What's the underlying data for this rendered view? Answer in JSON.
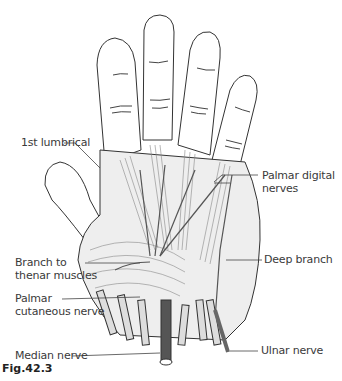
{
  "figure": {
    "caption": "Fig.42.3"
  },
  "labels": {
    "first_lumbrical": "1st lumbrical",
    "palmar_digital_nerves": "Palmar digital\nnerves",
    "deep_branch": "Deep branch",
    "branch_to_thenar": "Branch to\nthenar muscles",
    "palmar_cutaneous": "Palmar\ncutaneous nerve",
    "median_nerve": "Median nerve",
    "ulnar_nerve": "Ulnar nerve"
  },
  "colors": {
    "outline": "#333333",
    "muscle_fill": "#e6e6e6",
    "muscle_shade": "#c8c8c8",
    "nerve_dark": "#555555"
  }
}
